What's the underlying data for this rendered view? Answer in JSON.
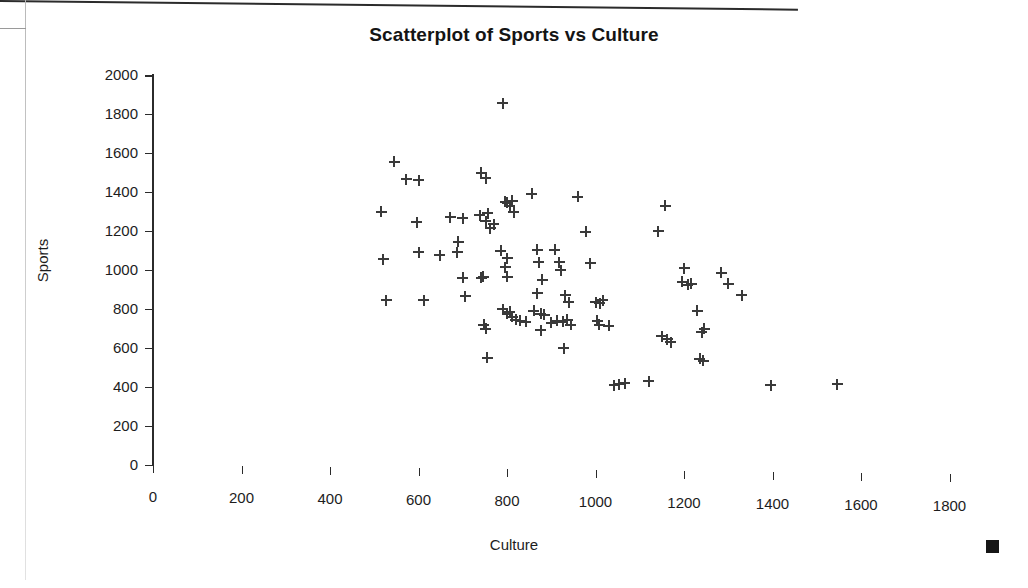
{
  "chart_data": {
    "type": "scatter",
    "title": "Scatterplot of Sports vs Culture",
    "xlabel": "Culture",
    "ylabel": "Sports",
    "xlim": [
      0,
      1800
    ],
    "ylim": [
      0,
      2000
    ],
    "xticks": [
      0,
      200,
      400,
      600,
      800,
      1000,
      1200,
      1400,
      1600,
      1800
    ],
    "yticks": [
      0,
      200,
      400,
      600,
      800,
      1000,
      1200,
      1400,
      1600,
      1800,
      2000
    ],
    "grid": false,
    "legend": false,
    "marker": "plus",
    "marker_color": "#3a3a3a",
    "series": [
      {
        "name": "Sports vs Culture",
        "points": [
          [
            516,
            1300
          ],
          [
            520,
            1055
          ],
          [
            527,
            845
          ],
          [
            545,
            1555
          ],
          [
            572,
            1465
          ],
          [
            600,
            1460
          ],
          [
            596,
            1245
          ],
          [
            600,
            1090
          ],
          [
            612,
            845
          ],
          [
            648,
            1075
          ],
          [
            672,
            1270
          ],
          [
            700,
            1265
          ],
          [
            690,
            1145
          ],
          [
            688,
            1090
          ],
          [
            700,
            960
          ],
          [
            706,
            865
          ],
          [
            742,
            1500
          ],
          [
            752,
            1470
          ],
          [
            738,
            1280
          ],
          [
            756,
            1290
          ],
          [
            752,
            1250
          ],
          [
            770,
            1235
          ],
          [
            762,
            1215
          ],
          [
            746,
            965
          ],
          [
            742,
            960
          ],
          [
            748,
            720
          ],
          [
            752,
            700
          ],
          [
            755,
            550
          ],
          [
            790,
            1855
          ],
          [
            796,
            1350
          ],
          [
            806,
            1330
          ],
          [
            812,
            1355
          ],
          [
            800,
            1345
          ],
          [
            815,
            1295
          ],
          [
            786,
            1100
          ],
          [
            800,
            1060
          ],
          [
            796,
            1015
          ],
          [
            800,
            965
          ],
          [
            790,
            800
          ],
          [
            800,
            775
          ],
          [
            806,
            785
          ],
          [
            812,
            760
          ],
          [
            820,
            745
          ],
          [
            830,
            740
          ],
          [
            842,
            735
          ],
          [
            856,
            1390
          ],
          [
            868,
            1105
          ],
          [
            872,
            1040
          ],
          [
            880,
            950
          ],
          [
            868,
            880
          ],
          [
            860,
            790
          ],
          [
            876,
            775
          ],
          [
            884,
            770
          ],
          [
            876,
            690
          ],
          [
            900,
            730
          ],
          [
            912,
            740
          ],
          [
            926,
            735
          ],
          [
            936,
            745
          ],
          [
            944,
            720
          ],
          [
            928,
            600
          ],
          [
            908,
            1105
          ],
          [
            918,
            1040
          ],
          [
            922,
            1000
          ],
          [
            932,
            870
          ],
          [
            940,
            835
          ],
          [
            960,
            1375
          ],
          [
            978,
            1195
          ],
          [
            988,
            1035
          ],
          [
            1000,
            835
          ],
          [
            1010,
            830
          ],
          [
            1016,
            845
          ],
          [
            1004,
            740
          ],
          [
            1008,
            720
          ],
          [
            1030,
            715
          ],
          [
            1042,
            410
          ],
          [
            1054,
            415
          ],
          [
            1066,
            420
          ],
          [
            1120,
            430
          ],
          [
            1142,
            1200
          ],
          [
            1158,
            1330
          ],
          [
            1150,
            660
          ],
          [
            1162,
            645
          ],
          [
            1170,
            630
          ],
          [
            1200,
            1010
          ],
          [
            1196,
            940
          ],
          [
            1208,
            925
          ],
          [
            1216,
            930
          ],
          [
            1230,
            790
          ],
          [
            1240,
            680
          ],
          [
            1246,
            700
          ],
          [
            1236,
            545
          ],
          [
            1244,
            535
          ],
          [
            1284,
            985
          ],
          [
            1300,
            930
          ],
          [
            1330,
            870
          ],
          [
            1396,
            410
          ],
          [
            1546,
            415
          ]
        ]
      }
    ]
  },
  "artifacts": {
    "corner_mark_label": "page-corner-mark",
    "scan_edge_label": "scan-edge"
  }
}
